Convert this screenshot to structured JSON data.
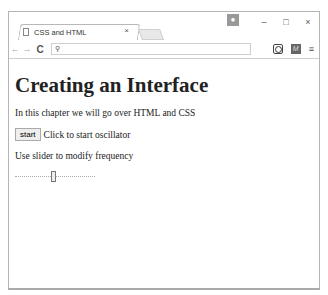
{
  "browser": {
    "tab_title": "CSS and HTML",
    "tab_close": "×",
    "profile_icon": "person",
    "window_controls": {
      "minimize": "–",
      "maximize": "□",
      "close": "×"
    },
    "nav": {
      "back": "←",
      "forward": "→",
      "reload": "C"
    },
    "omnibox": {
      "value": "",
      "search_icon": "🔍"
    },
    "extensions": [
      "tracker-icon",
      "M"
    ],
    "menu_icon": "≡"
  },
  "page": {
    "heading": "Creating an Interface",
    "intro": "In this chapter we will go over HTML and CSS",
    "start_button": "start",
    "start_caption": "Click to start oscillator",
    "slider_caption": "Use slider to modify frequency",
    "slider": {
      "position_percent": 48
    }
  }
}
